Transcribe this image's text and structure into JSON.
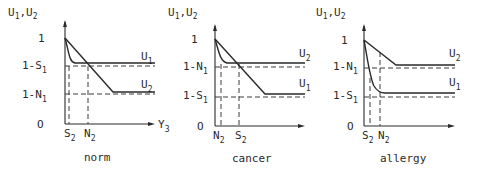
{
  "figure": {
    "panels": [
      {
        "id": "norm",
        "caption": "norm",
        "y_axis_label": {
          "main1": "U",
          "sub1": "1",
          "sep": ",",
          "main2": "U",
          "sub2": "2"
        },
        "x_axis_label": {
          "main": "Y",
          "sub": "3"
        },
        "y_ticks": [
          {
            "main": "1",
            "sub": "",
            "level": "one"
          },
          {
            "main": "1-S",
            "sub": "1",
            "level": "upper"
          },
          {
            "main": "1-N",
            "sub": "1",
            "level": "lower"
          },
          {
            "main": "O",
            "sub": "",
            "level": "zero"
          }
        ],
        "x_ticks": [
          {
            "main": "S",
            "sub": "2",
            "pos": "first"
          },
          {
            "main": "N",
            "sub": "2",
            "pos": "second"
          }
        ],
        "curves": [
          {
            "name": "U",
            "sub": "1",
            "shape": "fast-drop",
            "plateau": "upper"
          },
          {
            "name": "U",
            "sub": "2",
            "shape": "linear-slow",
            "plateau": "lower"
          }
        ]
      },
      {
        "id": "cancer",
        "caption": "cancer",
        "y_axis_label": {
          "main1": "U",
          "sub1": "1",
          "sep": ",",
          "main2": "U",
          "sub2": "2"
        },
        "y_ticks": [
          {
            "main": "1",
            "sub": "",
            "level": "one"
          },
          {
            "main": "1-N",
            "sub": "1",
            "level": "upper"
          },
          {
            "main": "1-S",
            "sub": "1",
            "level": "lower"
          },
          {
            "main": "O",
            "sub": "",
            "level": "zero"
          }
        ],
        "x_ticks": [
          {
            "main": "N",
            "sub": "2",
            "pos": "first"
          },
          {
            "main": "S",
            "sub": "2",
            "pos": "second"
          }
        ],
        "curves": [
          {
            "name": "U",
            "sub": "2",
            "shape": "fast-drop",
            "plateau": "upper"
          },
          {
            "name": "U",
            "sub": "1",
            "shape": "linear-slow",
            "plateau": "lower"
          }
        ]
      },
      {
        "id": "allergy",
        "caption": "allergy",
        "y_axis_label": {
          "main1": "U",
          "sub1": "1",
          "sep": ",",
          "main2": "U",
          "sub2": "2"
        },
        "y_ticks": [
          {
            "main": "1",
            "sub": "",
            "level": "one"
          },
          {
            "main": "1-N",
            "sub": "1",
            "level": "upper"
          },
          {
            "main": "1-S",
            "sub": "1",
            "level": "lower"
          },
          {
            "main": "O",
            "sub": "",
            "level": "zero"
          }
        ],
        "x_ticks": [
          {
            "main": "S",
            "sub": "2",
            "pos": "first"
          },
          {
            "main": "N",
            "sub": "2",
            "pos": "second"
          }
        ],
        "curves": [
          {
            "name": "U",
            "sub": "2",
            "shape": "linear-moderate",
            "plateau": "upper"
          },
          {
            "name": "U",
            "sub": "1",
            "shape": "fast-drop-deep",
            "plateau": "lower"
          }
        ]
      }
    ]
  }
}
